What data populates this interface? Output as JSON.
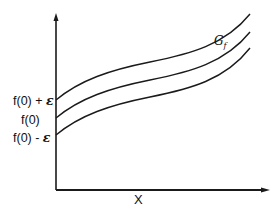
{
  "diagram": {
    "x_axis_label": "X",
    "curve_label": "G",
    "curve_label_sub": "f",
    "y_labels": {
      "upper": {
        "text": "f(0) + ",
        "symbol": "ε"
      },
      "middle": {
        "text": "f(0)"
      },
      "lower": {
        "text": "f(0) - ",
        "symbol": "ε"
      }
    },
    "curves": [
      {
        "name": "upper-bound",
        "meaning": "f + ε"
      },
      {
        "name": "graph-f",
        "meaning": "f"
      },
      {
        "name": "lower-bound",
        "meaning": "f - ε"
      }
    ],
    "colors": {
      "line": "#1a1a1a",
      "background": "#ffffff"
    }
  }
}
